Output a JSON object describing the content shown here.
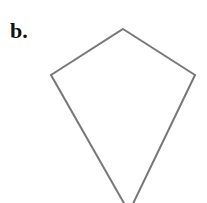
{
  "label": "b.",
  "shape": {
    "type": "kite",
    "stroke_color": "#777777",
    "vertices": [
      [
        123,
        29
      ],
      [
        195,
        75
      ],
      [
        129,
        212
      ],
      [
        51,
        75
      ]
    ]
  }
}
